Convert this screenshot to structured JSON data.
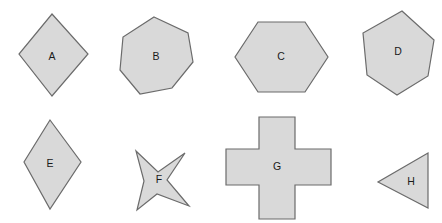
{
  "canvas": {
    "width": 442,
    "height": 223,
    "background": "#ffffff"
  },
  "style": {
    "fill": "#d9d9d9",
    "stroke": "#6b6b6b",
    "label_color": "#1a1a1a",
    "stroke_width": 1.2,
    "label_font_size": 10.5
  },
  "figure": {
    "type": "shape-grid",
    "rows": 2,
    "columns": 4,
    "shape_count": 8
  },
  "shapes": [
    {
      "label": "A",
      "name": "diamond-square",
      "sides": 4,
      "description": "square rotated 45 degrees",
      "row": 1,
      "column": 1,
      "points": "52,14 88,54 52,96 19,54",
      "label_x": 52,
      "label_y": 57
    },
    {
      "label": "B",
      "name": "heptagon",
      "sides": 7,
      "description": "irregular heptagon",
      "row": 1,
      "column": 2,
      "points": "154,17 188,33 193,62 172,88 140,94 120,70 123,37",
      "label_x": 156,
      "label_y": 57
    },
    {
      "label": "C",
      "name": "hexagon-flat-top",
      "sides": 6,
      "description": "regular hexagon with flat top and bottom",
      "row": 1,
      "column": 3,
      "points": "258,22 305,22 328,57 305,92 258,92 235,57",
      "label_x": 281,
      "label_y": 57
    },
    {
      "label": "D",
      "name": "hexagon-rotated",
      "sides": 6,
      "description": "hexagon rotated slightly",
      "row": 1,
      "column": 4,
      "points": "402,11 434,40 428,76 397,95 367,75 363,33",
      "label_x": 398,
      "label_y": 52
    },
    {
      "label": "E",
      "name": "rhombus-tall",
      "sides": 4,
      "description": "tall vertical rhombus",
      "row": 2,
      "column": 1,
      "points": "50,120 81,162 50,209 24,162",
      "label_x": 50,
      "label_y": 164
    },
    {
      "label": "F",
      "name": "four-pointed-star",
      "sides": 8,
      "description": "four pointed star, slightly rotated",
      "row": 2,
      "column": 2,
      "points": "136,151 158,172 185,153 167,180 189,206 157,194 137,210 144,181",
      "label_x": 159,
      "label_y": 180
    },
    {
      "label": "G",
      "name": "greek-cross",
      "sides": 12,
      "description": "symmetric plus or cross shape",
      "row": 2,
      "column": 3,
      "points": "259,117 295,117 295,149 331,149 331,185 295,185 295,219 259,219 259,185 226,185 226,149 259,149",
      "label_x": 277,
      "label_y": 167
    },
    {
      "label": "H",
      "name": "triangle-left-pointing",
      "sides": 3,
      "description": "triangle pointing left with vertical right edge",
      "row": 2,
      "column": 4,
      "points": "428,153 428,208 378,182",
      "label_x": 411,
      "label_y": 182
    }
  ]
}
